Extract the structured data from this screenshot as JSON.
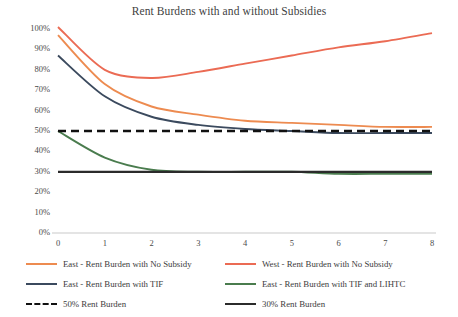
{
  "chart": {
    "title": "Rent Burdens with and without Subsidies",
    "type": "line"
  },
  "chart_data": {
    "type": "line",
    "title": "Rent Burdens with and without Subsidies",
    "xlabel": "",
    "ylabel": "",
    "xlim": [
      0,
      8
    ],
    "ylim": [
      0,
      100
    ],
    "grid": false,
    "legend_position": "bottom",
    "x": [
      0,
      1,
      2,
      3,
      4,
      5,
      6,
      7,
      8
    ],
    "x_tick_labels": [
      "0",
      "1",
      "2",
      "3",
      "4",
      "5",
      "6",
      "7",
      "8"
    ],
    "y_tick_labels": [
      "0%",
      "10%",
      "20%",
      "30%",
      "40%",
      "50%",
      "60%",
      "70%",
      "80%",
      "90%",
      "100%"
    ],
    "y_tick_values": [
      0,
      10,
      20,
      30,
      40,
      50,
      60,
      70,
      80,
      90,
      100
    ],
    "series": [
      {
        "name": "East - Rent Burden with No Subsidy",
        "color": "#ED8B50",
        "style": "solid",
        "values": [
          97,
          73,
          62,
          58,
          55,
          54,
          53,
          52,
          52
        ]
      },
      {
        "name": "West - Rent Burden with No Subsidy",
        "color": "#EB6B54",
        "style": "solid",
        "values": [
          101,
          80,
          76,
          79,
          83,
          87,
          91,
          94,
          98
        ]
      },
      {
        "name": "East - Rent Burden with TIF",
        "color": "#3B4A5E",
        "style": "solid",
        "values": [
          87,
          67,
          57,
          53,
          51,
          50,
          49,
          49,
          49
        ]
      },
      {
        "name": "East - Rent Burden with TIF and LIHTC",
        "color": "#4A7C4E",
        "style": "solid",
        "values": [
          50,
          37,
          31,
          30,
          30,
          30,
          29,
          29,
          29
        ]
      },
      {
        "name": "50% Rent Burden",
        "color": "#111111",
        "style": "dashed",
        "values": [
          50,
          50,
          50,
          50,
          50,
          50,
          50,
          50,
          50
        ]
      },
      {
        "name": "30% Rent Burden",
        "color": "#2B2B2B",
        "style": "solid",
        "values": [
          30,
          30,
          30,
          30,
          30,
          30,
          30,
          30,
          30
        ]
      }
    ]
  },
  "legend": {
    "items": [
      {
        "label": "East - Rent Burden with No Subsidy",
        "color": "#ED8B50",
        "style": "solid"
      },
      {
        "label": "West - Rent Burden with No Subsidy",
        "color": "#EB6B54",
        "style": "solid"
      },
      {
        "label": "East - Rent Burden with TIF",
        "color": "#3B4A5E",
        "style": "solid"
      },
      {
        "label": "East - Rent Burden with TIF and LIHTC",
        "color": "#4A7C4E",
        "style": "solid"
      },
      {
        "label": "50% Rent Burden",
        "color": "#111111",
        "style": "dashed"
      },
      {
        "label": "30% Rent Burden",
        "color": "#2B2B2B",
        "style": "solid"
      }
    ]
  }
}
